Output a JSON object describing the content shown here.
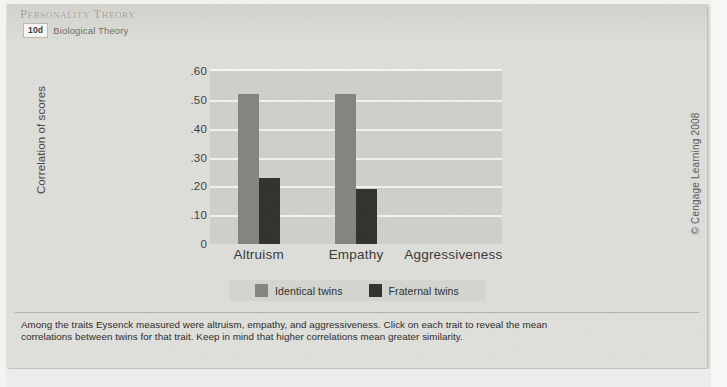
{
  "header": {
    "course_title": "Personality Theory",
    "module_badge": "10d",
    "module_name": "Biological Theory"
  },
  "caption": {
    "text": "Among the traits Eysenck measured were altruism, empathy, and aggressiveness. Click on each trait to reveal the mean correlations between twins for that trait. Keep in mind that higher correlations mean greater similarity."
  },
  "controls": {
    "volume_label": "volume",
    "play_label": "play",
    "previous_label": "previous",
    "next_label": "next"
  },
  "copyright": {
    "text": "© Cengage Learning 2008"
  },
  "colors": {
    "identical": "#85857f",
    "fraternal": "#333331",
    "plot_background": "#cfcfca",
    "gridline": "#f0f0ec",
    "window_background": "#dcdcd8"
  },
  "chart_data": {
    "type": "bar",
    "title": "",
    "xlabel": "",
    "ylabel": "Correlation of scores",
    "categories": [
      "Altruism",
      "Empathy",
      "Aggressiveness"
    ],
    "ylim": [
      0,
      0.6
    ],
    "yticks": [
      0.6,
      0.5,
      0.4,
      0.3,
      0.2,
      0.1,
      0
    ],
    "ytick_labels": [
      ".60",
      ".50",
      ".40",
      ".30",
      ".20",
      ".10",
      "0"
    ],
    "grid": true,
    "legend_position": "bottom",
    "series": [
      {
        "name": "Identical twins",
        "color": "#85857f",
        "values": [
          0.52,
          0.52,
          null
        ]
      },
      {
        "name": "Fraternal twins",
        "color": "#333331",
        "values": [
          0.23,
          0.19,
          null
        ]
      }
    ]
  }
}
